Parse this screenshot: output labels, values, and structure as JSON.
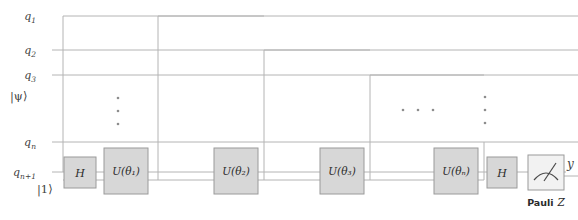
{
  "figure": {
    "type": "quantum-circuit-diagram",
    "width": 578,
    "height": 220,
    "background": "#ffffff"
  },
  "wires": [
    {
      "name": "q1",
      "label": "q",
      "subscript": "1",
      "y": 16
    },
    {
      "name": "q2",
      "label": "q",
      "subscript": "2",
      "y": 50
    },
    {
      "name": "q3",
      "label": "q",
      "subscript": "3",
      "y": 75
    },
    {
      "name": "qn",
      "label": "q",
      "subscript": "n",
      "y": 142
    },
    {
      "name": "qn1",
      "label": "q",
      "subscript": "n+1",
      "y": 172
    }
  ],
  "state_labels": {
    "psi": "|ψ⟩",
    "psi_x": 12,
    "psi_y": 96,
    "one": "|1⟩",
    "one_x": 44,
    "one_y": 190
  },
  "gates": [
    {
      "name": "hadamard-first",
      "label": "H",
      "x": 64,
      "y": 157,
      "w": 32,
      "h": 31,
      "fill": "#d7d7d7",
      "stroke": "#9a9a9a"
    },
    {
      "name": "u-theta-1",
      "label": "U(θ₁)",
      "x": 104,
      "y": 148,
      "w": 44,
      "h": 46,
      "fill": "#d7d7d7",
      "stroke": "#9a9a9a"
    },
    {
      "name": "u-theta-2",
      "label": "U(θ₂)",
      "x": 214,
      "y": 148,
      "w": 44,
      "h": 46,
      "fill": "#d7d7d7",
      "stroke": "#9a9a9a"
    },
    {
      "name": "u-theta-3",
      "label": "U(θ₃)",
      "x": 320,
      "y": 148,
      "w": 44,
      "h": 46,
      "fill": "#d7d7d7",
      "stroke": "#9a9a9a"
    },
    {
      "name": "u-theta-n",
      "label": "U(θₙ)",
      "x": 434,
      "y": 148,
      "w": 44,
      "h": 46,
      "fill": "#d7d7d7",
      "stroke": "#9a9a9a"
    },
    {
      "name": "hadamard-last",
      "label": "H",
      "x": 487,
      "y": 157,
      "w": 30,
      "h": 31,
      "fill": "#d7d7d7",
      "stroke": "#9a9a9a"
    }
  ],
  "measurement": {
    "name": "pauli-z-measurement",
    "x": 528,
    "y": 155,
    "w": 36,
    "h": 35,
    "fill": "#f2f2f2",
    "stroke": "#9a9a9a",
    "caption": "Pauli",
    "caption_operator": "Z",
    "output_label": "y"
  },
  "control_lines": [
    {
      "name": "control-q1-to-h",
      "from_wire": "q1",
      "x": 63,
      "top": 16,
      "bottom": 172
    },
    {
      "name": "control-q1-to-u1",
      "from_wire": "q1",
      "x": 158,
      "top": 16,
      "bottom": 180
    },
    {
      "name": "control-q2-to-u2",
      "from_wire": "q2",
      "x": 264,
      "top": 50,
      "bottom": 180
    },
    {
      "name": "control-q3-to-u3",
      "from_wire": "q3",
      "x": 370,
      "top": 75,
      "bottom": 180
    },
    {
      "name": "control-qn-to-un",
      "from_wire": "qn",
      "x": 484,
      "top": 142,
      "bottom": 180
    }
  ],
  "ellipses": {
    "vertical_left": {
      "name": "vertical-ellipsis-left",
      "x": 118,
      "ys": [
        98,
        111,
        124
      ]
    },
    "vertical_right": {
      "name": "vertical-ellipsis-right",
      "x": 485,
      "ys": [
        97,
        110,
        123
      ]
    },
    "horizontal": {
      "name": "horizontal-ellipsis",
      "y": 110,
      "xs": [
        403,
        418,
        433
      ]
    }
  },
  "colors": {
    "wire": "#b4b4b4",
    "gate_fill": "#d7d7d7",
    "gate_stroke": "#9a9a9a",
    "text": "#3f3f3f",
    "dots": "#8d8d8d"
  }
}
